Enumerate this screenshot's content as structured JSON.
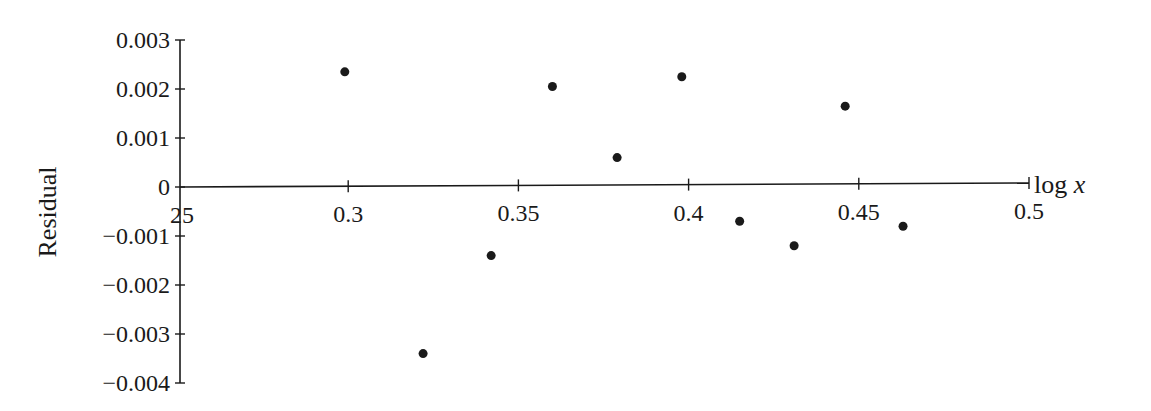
{
  "chart_data": {
    "type": "scatter",
    "title": "",
    "xlabel": "log x",
    "ylabel": "Residual",
    "xlim": [
      0.25,
      0.5
    ],
    "ylim": [
      -0.004,
      0.003
    ],
    "grid": false,
    "legend": null,
    "x_ticks": [
      "0.25",
      "0.3",
      "0.35",
      "0.4",
      "0.45",
      "0.5"
    ],
    "y_ticks": [
      "0.003",
      "0.002",
      "0.001",
      "0",
      "−0.001",
      "−0.002",
      "−0.003",
      "−0.004"
    ],
    "series": [
      {
        "name": "residuals",
        "color": "#1a1a1a",
        "points": [
          {
            "x": 0.299,
            "y": 0.00235
          },
          {
            "x": 0.322,
            "y": -0.0034
          },
          {
            "x": 0.342,
            "y": -0.0014
          },
          {
            "x": 0.36,
            "y": 0.00205
          },
          {
            "x": 0.379,
            "y": 0.0006
          },
          {
            "x": 0.398,
            "y": 0.00225
          },
          {
            "x": 0.415,
            "y": -0.0007
          },
          {
            "x": 0.431,
            "y": -0.0012
          },
          {
            "x": 0.446,
            "y": 0.00165
          },
          {
            "x": 0.463,
            "y": -0.0008
          }
        ]
      }
    ]
  },
  "labels": {
    "x_axis_title": "log x",
    "x_axis_title_base": "log ",
    "x_axis_title_var": "x",
    "y_axis_title": "Residual",
    "x_tick_first_visible": "25"
  }
}
